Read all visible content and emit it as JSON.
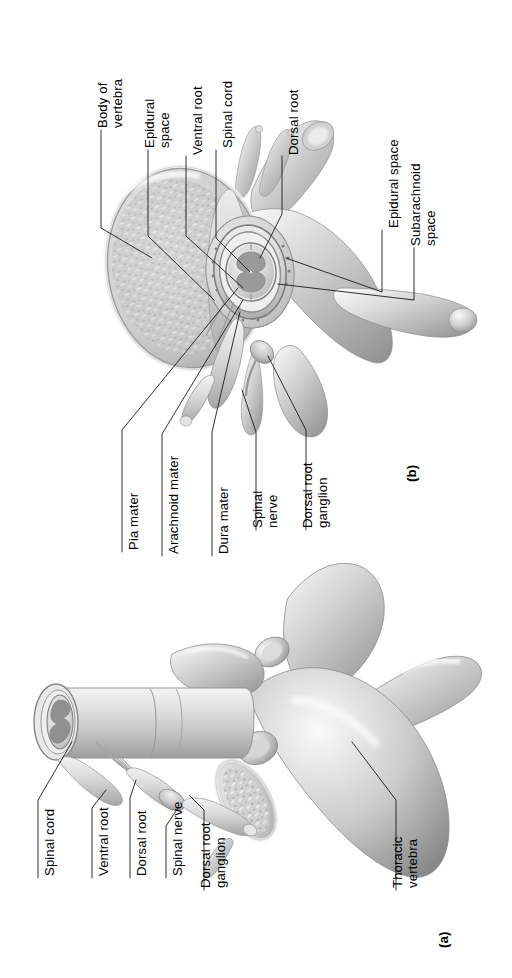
{
  "figure": {
    "panels": [
      {
        "id": "a",
        "label": "(a)",
        "caption": "Thoracic vertebra with spinal cord, lateral view"
      },
      {
        "id": "b",
        "label": "(b)",
        "caption": "Vertebra and spinal cord, superior cross-sectional view"
      }
    ]
  },
  "panel_b_labels": {
    "body_of_vertebra": {
      "line1": "Body of",
      "line2": "vertebra"
    },
    "epidural_space_left": {
      "line1": "Epidural",
      "line2": "space"
    },
    "ventral_root": {
      "line1": "Ventral root"
    },
    "spinal_cord": {
      "line1": "Spinal cord"
    },
    "dorsal_root": {
      "line1": "Dorsal root"
    },
    "epidural_space_right": {
      "line1": "Epidural space"
    },
    "subarachnoid_space": {
      "line1": "Subarachnoid",
      "line2": "space"
    },
    "pia_mater": {
      "line1": "Pia mater"
    },
    "arachnoid_mater": {
      "line1": "Arachnoid mater"
    },
    "dura_mater": {
      "line1": "Dura mater"
    },
    "spinal_nerve": {
      "line1": "Spinal",
      "line2": "nerve"
    },
    "dorsal_root_ganglion": {
      "line1": "Dorsal root",
      "line2": "ganglion"
    }
  },
  "panel_a_labels": {
    "spinal_cord": {
      "line1": "Spinal cord"
    },
    "ventral_root": {
      "line1": "Ventral root"
    },
    "dorsal_root": {
      "line1": "Dorsal root"
    },
    "spinal_nerve": {
      "line1": "Spinal nerve"
    },
    "dorsal_root_ganglion": {
      "line1": "Dorsal root",
      "line2": "ganglion"
    },
    "thoracic_vertebra": {
      "line1": "Thoracic",
      "line2": "vertebra"
    }
  },
  "colors": {
    "background": "#ffffff",
    "text": "#000000",
    "leader_line": "#1a1a1a",
    "bone_light": "#f2f2f2",
    "bone_mid": "#c9c9c9",
    "bone_shadow": "#8f8f8f",
    "cord_light": "#e8e8e8",
    "cord_mid": "#bdbdbd",
    "gray_matter": "#9a9a9a",
    "dura": "#d6d6d6",
    "marrow": "#d9d9d9"
  }
}
